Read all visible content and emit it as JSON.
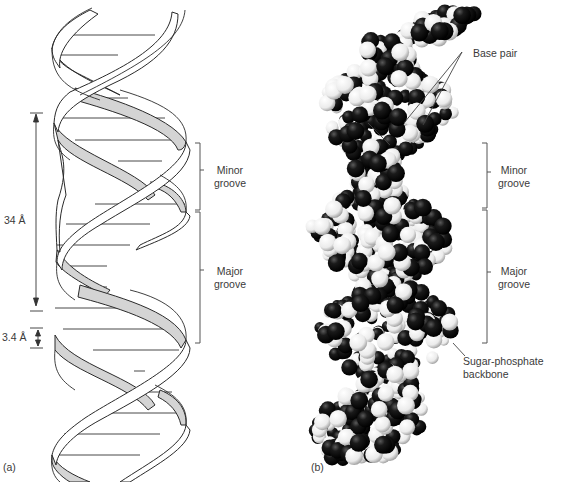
{
  "figure": {
    "panels": [
      {
        "id": "a",
        "letter": "(a)",
        "type": "ribbon-helix-schematic",
        "annotations": {
          "helix_pitch": "34 Å",
          "base_spacing": "3.4 Å",
          "minor_groove": [
            "Minor",
            "groove"
          ],
          "major_groove": [
            "Major",
            "groove"
          ]
        }
      },
      {
        "id": "b",
        "letter": "(b)",
        "type": "space-filling-model",
        "annotations": {
          "base_pair": "Base pair",
          "minor_groove": [
            "Minor",
            "groove"
          ],
          "major_groove": [
            "Major",
            "groove"
          ],
          "backbone": [
            "Sugar-phosphate",
            "backbone"
          ]
        }
      }
    ],
    "colors": {
      "ribbon_outline": "#2a2a2a",
      "ribbon_shaded": "#d4d4d4",
      "ribbon_light": "#ffffff",
      "atom_dark": "#111111",
      "atom_light": "#f4f4f4",
      "label_text": "#3a3a3a",
      "bracket": "#555555"
    }
  }
}
